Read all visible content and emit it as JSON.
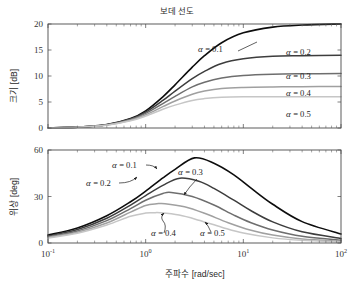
{
  "figure": {
    "title": "보데 선도",
    "xlabel": "주파수 [rad/sec]",
    "panels": [
      {
        "ylabel_text": "크기",
        "ylabel_unit": "[dB]"
      },
      {
        "ylabel_text": "위상",
        "ylabel_unit": "[deg]"
      }
    ]
  },
  "axis": {
    "x_tick_labels": [
      "10",
      "10",
      "10",
      "10"
    ],
    "x_tick_exponents": [
      "-1",
      "0",
      "1",
      "2"
    ],
    "mag_tick_labels": [
      "0",
      "5",
      "10",
      "15",
      "20"
    ],
    "phase_tick_labels": [
      "0",
      "30",
      "60"
    ]
  },
  "annotations": {
    "mag": [
      {
        "label": "α = 0.1",
        "alpha_symbol": "α",
        "eq": "= 0.1"
      },
      {
        "label": "α = 0.2",
        "alpha_symbol": "α",
        "eq": "= 0.2"
      },
      {
        "label": "α = 0.3",
        "alpha_symbol": "α",
        "eq": "= 0.3"
      },
      {
        "label": "α = 0.4",
        "alpha_symbol": "α",
        "eq": "= 0.4"
      },
      {
        "label": "α = 0.5",
        "alpha_symbol": "α",
        "eq": "= 0.5"
      }
    ],
    "phase": [
      {
        "label": "α = 0.1",
        "alpha_symbol": "α",
        "eq": "= 0.1"
      },
      {
        "label": "α = 0.2",
        "alpha_symbol": "α",
        "eq": "= 0.2"
      },
      {
        "label": "α = 0.3",
        "alpha_symbol": "α",
        "eq": "= 0.3"
      },
      {
        "label": "α = 0.4",
        "alpha_symbol": "α",
        "eq": "= 0.4"
      },
      {
        "label": "α = 0.5",
        "alpha_symbol": "α",
        "eq": "= 0.5"
      }
    ]
  },
  "chart_data": {
    "type": "line",
    "title": "보데 선도",
    "xlabel": "주파수 [rad/sec]",
    "xscale": "log",
    "xlim": [
      0.1,
      100
    ],
    "xticks": [
      0.1,
      1,
      10,
      100
    ],
    "xtick_labels": [
      "10^-1",
      "10^0",
      "10^1",
      "10^2"
    ],
    "panels": [
      {
        "name": "magnitude",
        "ylabel": "크기 [dB]",
        "ylim": [
          0,
          20
        ],
        "yticks": [
          0,
          5,
          10,
          15,
          20
        ],
        "grid": false,
        "series": [
          {
            "name": "α = 0.1",
            "alpha": 0.1,
            "color": "#0d0d0d",
            "linewidth": 1.6,
            "plateau_db": 20.0,
            "x": [
              0.1,
              0.2,
              0.4,
              0.7,
              1.0,
              1.5,
              2.0,
              3.0,
              4.0,
              6.0,
              10.0,
              20.0,
              40.0,
              100.0
            ],
            "y": [
              0.04,
              0.17,
              0.65,
              1.82,
              3.3,
              6.0,
              8.3,
              11.7,
              13.9,
              16.4,
              18.3,
              19.4,
              19.8,
              20.0
            ]
          },
          {
            "name": "α = 0.2",
            "alpha": 0.2,
            "color": "#3d3d3d",
            "linewidth": 1.5,
            "plateau_db": 13.98,
            "x": [
              0.1,
              0.2,
              0.4,
              0.7,
              1.0,
              1.5,
              2.0,
              3.0,
              4.0,
              6.0,
              10.0,
              20.0,
              40.0,
              100.0
            ],
            "y": [
              0.04,
              0.17,
              0.63,
              1.72,
              3.05,
              5.3,
              7.1,
              9.5,
              10.9,
              12.4,
              13.3,
              13.8,
              13.9,
              13.98
            ]
          },
          {
            "name": "α = 0.3",
            "alpha": 0.3,
            "color": "#6e6e6e",
            "linewidth": 1.5,
            "plateau_db": 10.46,
            "x": [
              0.1,
              0.2,
              0.4,
              0.7,
              1.0,
              1.5,
              2.0,
              3.0,
              4.0,
              6.0,
              10.0,
              20.0,
              40.0,
              100.0
            ],
            "y": [
              0.04,
              0.16,
              0.61,
              1.62,
              2.8,
              4.7,
              6.1,
              7.9,
              8.8,
              9.6,
              10.1,
              10.35,
              10.43,
              10.46
            ]
          },
          {
            "name": "α = 0.4",
            "alpha": 0.4,
            "color": "#a0a0a0",
            "linewidth": 1.5,
            "plateau_db": 7.96,
            "x": [
              0.1,
              0.2,
              0.4,
              0.7,
              1.0,
              1.5,
              2.0,
              3.0,
              4.0,
              6.0,
              10.0,
              20.0,
              40.0,
              100.0
            ],
            "y": [
              0.04,
              0.15,
              0.58,
              1.5,
              2.55,
              4.1,
              5.2,
              6.5,
              7.1,
              7.6,
              7.8,
              7.9,
              7.95,
              7.96
            ]
          },
          {
            "name": "α = 0.5",
            "alpha": 0.5,
            "color": "#c6c6c6",
            "linewidth": 1.5,
            "plateau_db": 6.02,
            "x": [
              0.1,
              0.2,
              0.4,
              0.7,
              1.0,
              1.5,
              2.0,
              3.0,
              4.0,
              6.0,
              10.0,
              20.0,
              40.0,
              100.0
            ],
            "y": [
              0.03,
              0.14,
              0.54,
              1.38,
              2.3,
              3.6,
              4.4,
              5.3,
              5.65,
              5.9,
              6.0,
              6.01,
              6.02,
              6.02
            ]
          }
        ]
      },
      {
        "name": "phase",
        "ylabel": "위상 [deg]",
        "ylim": [
          0,
          60
        ],
        "yticks": [
          0,
          30,
          60
        ],
        "grid": false,
        "series": [
          {
            "name": "α = 0.1",
            "alpha": 0.1,
            "color": "#0d0d0d",
            "linewidth": 1.6,
            "peak_deg": 54.9,
            "peak_omega": 3.16,
            "x": [
              0.1,
              0.2,
              0.4,
              0.7,
              1.0,
              1.5,
              2.0,
              3.16,
              5.0,
              8.0,
              12.0,
              20.0,
              40.0,
              100.0
            ],
            "y": [
              5.1,
              9.7,
              17.6,
              26.6,
              33.5,
              42.0,
              47.5,
              54.9,
              51.5,
              44.0,
              35.4,
              25.0,
              13.8,
              5.8
            ]
          },
          {
            "name": "α = 0.2",
            "alpha": 0.2,
            "color": "#3d3d3d",
            "linewidth": 1.5,
            "peak_deg": 41.8,
            "peak_omega": 2.24,
            "x": [
              0.1,
              0.2,
              0.4,
              0.7,
              1.0,
              1.5,
              2.24,
              3.5,
              5.0,
              8.0,
              12.0,
              20.0,
              40.0,
              100.0
            ],
            "y": [
              4.5,
              8.7,
              16.0,
              24.5,
              30.6,
              37.2,
              41.8,
              39.8,
              35.2,
              27.6,
              20.8,
              13.6,
              7.2,
              2.9
            ]
          },
          {
            "name": "α = 0.3",
            "alpha": 0.3,
            "color": "#6e6e6e",
            "linewidth": 1.5,
            "peak_deg": 32.6,
            "peak_omega": 1.83,
            "x": [
              0.1,
              0.2,
              0.4,
              0.7,
              1.0,
              1.5,
              1.83,
              3.0,
              5.0,
              8.0,
              12.0,
              20.0,
              40.0,
              100.0
            ],
            "y": [
              4.0,
              7.8,
              14.4,
              22.2,
              27.6,
              31.9,
              32.6,
              30.0,
              24.5,
              18.0,
              13.1,
              8.4,
              4.3,
              1.8
            ]
          },
          {
            "name": "α = 0.4",
            "alpha": 0.4,
            "color": "#a0a0a0",
            "linewidth": 1.5,
            "peak_deg": 25.4,
            "peak_omega": 1.58,
            "x": [
              0.1,
              0.2,
              0.4,
              0.7,
              1.0,
              1.3,
              1.58,
              2.5,
              4.0,
              7.0,
              12.0,
              20.0,
              40.0,
              100.0
            ],
            "y": [
              3.6,
              7.0,
              12.9,
              19.9,
              24.2,
              25.3,
              25.4,
              23.4,
              19.2,
              13.1,
              8.2,
              5.1,
              2.6,
              1.1
            ]
          },
          {
            "name": "α = 0.5",
            "alpha": 0.5,
            "color": "#c6c6c6",
            "linewidth": 1.5,
            "peak_deg": 19.5,
            "peak_omega": 1.41,
            "x": [
              0.1,
              0.2,
              0.4,
              0.7,
              1.0,
              1.2,
              1.41,
              2.2,
              3.5,
              6.0,
              10.0,
              20.0,
              40.0,
              100.0
            ],
            "y": [
              3.2,
              6.3,
              11.6,
              17.2,
              19.3,
              19.5,
              19.5,
              18.0,
              14.7,
              10.2,
              6.4,
              3.3,
              1.7,
              0.7
            ]
          }
        ]
      }
    ]
  }
}
